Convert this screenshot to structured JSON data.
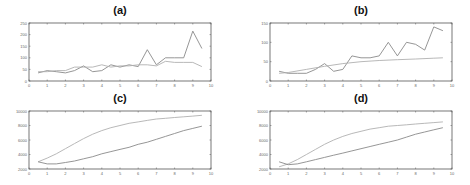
{
  "chart_data": [
    {
      "id": "a",
      "type": "line",
      "title": "(a)",
      "xlabel": "",
      "ylabel": "",
      "xlim": [
        0,
        10
      ],
      "ylim": [
        0,
        250
      ],
      "xticks": [
        0,
        1,
        2,
        3,
        4,
        5,
        6,
        7,
        8,
        9,
        10
      ],
      "yticks": [
        0,
        50,
        100,
        150,
        200,
        250
      ],
      "grid": false,
      "frame": {
        "x": 29,
        "y": 23,
        "w": 182,
        "h": 58
      },
      "series": [
        {
          "name": "actual",
          "color": "#8a8a8a",
          "x": [
            0.5,
            1,
            1.5,
            2,
            2.5,
            3,
            3.5,
            4,
            4.5,
            5,
            5.5,
            6,
            6.5,
            7,
            7.5,
            8,
            8.5,
            9,
            9.5
          ],
          "y": [
            35,
            45,
            40,
            35,
            45,
            65,
            40,
            45,
            70,
            60,
            70,
            62,
            135,
            70,
            100,
            100,
            100,
            215,
            140
          ]
        },
        {
          "name": "fitted",
          "color": "#b0b0b0",
          "x": [
            0.5,
            1,
            1.5,
            2,
            2.5,
            3,
            3.5,
            4,
            4.5,
            5,
            5.5,
            6,
            6.5,
            7,
            7.5,
            8,
            8.5,
            9,
            9.5
          ],
          "y": [
            40,
            40,
            45,
            45,
            60,
            60,
            60,
            70,
            60,
            65,
            65,
            70,
            70,
            65,
            85,
            80,
            80,
            80,
            62
          ]
        }
      ]
    },
    {
      "id": "b",
      "type": "line",
      "title": "(b)",
      "xlabel": "",
      "ylabel": "",
      "xlim": [
        0,
        10
      ],
      "ylim": [
        0,
        150
      ],
      "xticks": [
        0,
        1,
        2,
        3,
        4,
        5,
        6,
        7,
        8,
        9,
        10
      ],
      "yticks": [
        0,
        50,
        100,
        150
      ],
      "grid": false,
      "frame": {
        "x": 270,
        "y": 23,
        "w": 182,
        "h": 58
      },
      "series": [
        {
          "name": "actual",
          "color": "#8a8a8a",
          "x": [
            0.5,
            1,
            1.5,
            2,
            2.5,
            3,
            3.5,
            4,
            4.5,
            5,
            5.5,
            6,
            6.5,
            7,
            7.5,
            8,
            8.5,
            9,
            9.5
          ],
          "y": [
            25,
            20,
            20,
            20,
            30,
            45,
            25,
            30,
            65,
            60,
            60,
            65,
            100,
            65,
            100,
            95,
            80,
            140,
            130
          ]
        },
        {
          "name": "fitted",
          "color": "#b0b0b0",
          "x": [
            0.5,
            1,
            2,
            3,
            4,
            5,
            6,
            7,
            8,
            9,
            9.5
          ],
          "y": [
            20,
            22,
            30,
            38,
            45,
            50,
            53,
            55,
            57,
            59,
            60
          ]
        }
      ]
    },
    {
      "id": "c",
      "type": "line",
      "title": "(c)",
      "xlabel": "",
      "ylabel": "",
      "xlim": [
        0,
        10
      ],
      "ylim": [
        2000,
        10000
      ],
      "xticks": [
        0,
        1,
        2,
        3,
        4,
        5,
        6,
        7,
        8,
        9,
        10
      ],
      "yticks": [
        2000,
        4000,
        6000,
        8000,
        10000
      ],
      "grid": false,
      "frame": {
        "x": 29,
        "y": 111,
        "w": 182,
        "h": 58
      },
      "series": [
        {
          "name": "upper",
          "color": "#b0b0b0",
          "x": [
            0.5,
            1,
            1.5,
            2,
            2.5,
            3,
            3.5,
            4,
            4.5,
            5,
            5.5,
            6,
            6.5,
            7,
            7.5,
            8,
            8.5,
            9,
            9.5
          ],
          "y": [
            3000,
            3500,
            4100,
            4800,
            5500,
            6200,
            6800,
            7300,
            7700,
            8000,
            8300,
            8500,
            8700,
            8900,
            9000,
            9100,
            9200,
            9300,
            9400
          ]
        },
        {
          "name": "lower",
          "color": "#8a8a8a",
          "x": [
            0.5,
            1,
            1.5,
            2,
            2.5,
            3,
            3.5,
            4,
            4.5,
            5,
            5.5,
            6,
            6.5,
            7,
            7.5,
            8,
            8.5,
            9,
            9.5
          ],
          "y": [
            3000,
            2700,
            2700,
            2900,
            3100,
            3400,
            3700,
            4100,
            4400,
            4700,
            5000,
            5400,
            5700,
            6100,
            6500,
            6900,
            7300,
            7600,
            7900
          ]
        }
      ]
    },
    {
      "id": "d",
      "type": "line",
      "title": "(d)",
      "xlabel": "",
      "ylabel": "",
      "xlim": [
        0,
        10
      ],
      "ylim": [
        2000,
        10000
      ],
      "xticks": [
        0,
        1,
        2,
        3,
        4,
        5,
        6,
        7,
        8,
        9,
        10
      ],
      "yticks": [
        2000,
        4000,
        6000,
        8000,
        10000
      ],
      "grid": false,
      "frame": {
        "x": 270,
        "y": 111,
        "w": 182,
        "h": 58
      },
      "series": [
        {
          "name": "upper",
          "color": "#b0b0b0",
          "x": [
            0.5,
            1,
            1.5,
            2,
            2.5,
            3,
            3.5,
            4,
            4.5,
            5,
            5.5,
            6,
            6.5,
            7,
            7.5,
            8,
            8.5,
            9,
            9.5
          ],
          "y": [
            2300,
            2700,
            3300,
            4000,
            4700,
            5400,
            6000,
            6500,
            6900,
            7200,
            7500,
            7700,
            7900,
            8000,
            8100,
            8200,
            8300,
            8400,
            8500
          ]
        },
        {
          "name": "lower",
          "color": "#8a8a8a",
          "x": [
            0.5,
            1,
            1.5,
            2,
            2.5,
            3,
            3.5,
            4,
            4.5,
            5,
            5.5,
            6,
            6.5,
            7,
            7.5,
            8,
            8.5,
            9,
            9.5
          ],
          "y": [
            3000,
            2600,
            2700,
            3000,
            3300,
            3600,
            3900,
            4200,
            4500,
            4800,
            5100,
            5400,
            5700,
            6000,
            6400,
            6800,
            7100,
            7400,
            7700
          ]
        }
      ]
    }
  ]
}
